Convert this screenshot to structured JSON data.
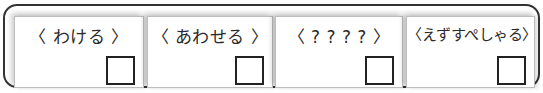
{
  "cards": [
    {
      "label": "〈 わける 〉",
      "checked": false
    },
    {
      "label": "〈 あわせる 〉",
      "checked": false
    },
    {
      "label": "〈 ? ? ? ? 〉",
      "checked": false
    },
    {
      "label": "〈えずすぺしゃる〉",
      "checked": false
    }
  ],
  "colors": {
    "frame_border": "#333333",
    "card_border": "#bdbdbd",
    "checkbox_border": "#222222",
    "text": "#2a2a2a"
  }
}
